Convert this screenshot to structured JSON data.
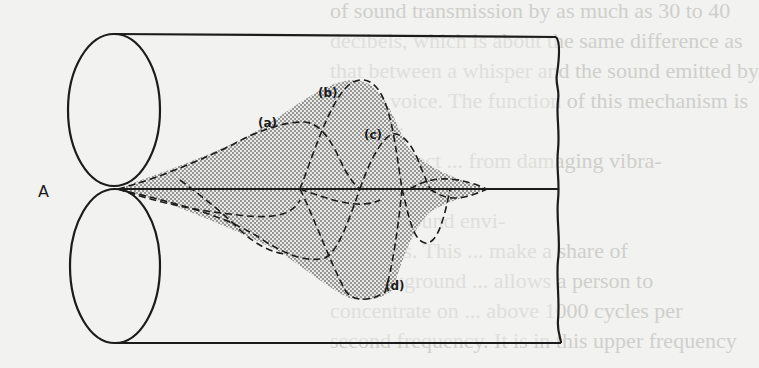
{
  "figure": {
    "kind": "scanned textbook diagram",
    "labels": {
      "origin": "A",
      "curve_a": "(a)",
      "curve_b": "(b)",
      "curve_c": "(c)",
      "curve_d": "(d)"
    },
    "colors": {
      "ink": "#1c1c1c",
      "paper": "#f2f2f0",
      "stipple": "#8a8a8a",
      "bleed_text": "#cfcfcc"
    }
  },
  "bleed_through_text": [
    {
      "text": "of sound transmission by as much as 30 to 40",
      "x": 330,
      "y": 4
    },
    {
      "text": "decibels, which is about the same difference as",
      "x": 330,
      "y": 34
    },
    {
      "text": "that between a whisper and the sound emitted by",
      "x": 330,
      "y": 64
    },
    {
      "text": "a loud voice. The function of this mechanism is",
      "x": 330,
      "y": 94
    },
    {
      "text": "twofold:",
      "x": 330,
      "y": 124
    },
    {
      "text": "1. To protect ... from damaging vibra-",
      "x": 330,
      "y": 154
    },
    {
      "text": "tions caused ...",
      "x": 330,
      "y": 184
    },
    {
      "text": "2. To ... sound envi-",
      "x": 330,
      "y": 214
    },
    {
      "text": "ronments. This ... make a share of",
      "x": 330,
      "y": 244
    },
    {
      "text": "the background ... allows a person to",
      "x": 330,
      "y": 274
    },
    {
      "text": "concentrate on ... above 1000 cycles per",
      "x": 330,
      "y": 304
    },
    {
      "text": "second frequency. It is in this upper frequency",
      "x": 330,
      "y": 334
    }
  ]
}
